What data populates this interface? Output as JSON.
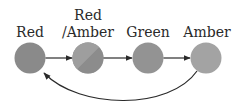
{
  "diagram": {
    "states": [
      {
        "id": "red",
        "label_line1": "Red",
        "label_line2": "",
        "fill": "#8a8a8a",
        "fill2": null
      },
      {
        "id": "red-amber",
        "label_line1": "Red",
        "label_line2": "/Amber",
        "fill": "#9c9c9c",
        "fill2": "#888888"
      },
      {
        "id": "green",
        "label_line1": "Green",
        "label_line2": "",
        "fill": "#929292"
      },
      {
        "id": "amber",
        "label_line1": "Amber",
        "label_line2": "",
        "fill": "#a2a2a2"
      }
    ],
    "transitions": [
      {
        "from": "red",
        "to": "red-amber"
      },
      {
        "from": "red-amber",
        "to": "green"
      },
      {
        "from": "green",
        "to": "amber"
      },
      {
        "from": "amber",
        "to": "red",
        "curved": true
      }
    ],
    "colors": {
      "edge": "#2a2a2a",
      "text": "#2a2a2a",
      "background": "#ffffff"
    }
  }
}
